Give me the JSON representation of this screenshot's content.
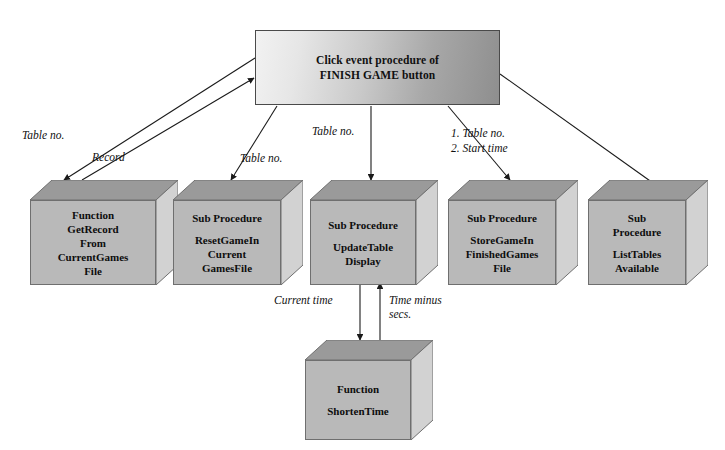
{
  "diagram": {
    "background_color": "#ffffff",
    "box_fill_color": "#b9b9b9",
    "box_top_face_color": "#9a9a9a",
    "box_side_face_color": "#d2d2d2",
    "line_color": "#1a1a1a"
  },
  "root": {
    "line1": "Click event procedure of",
    "line2": "FINISH GAME button"
  },
  "modules": [
    {
      "id": "get-record",
      "kind": "Function",
      "header": "Function",
      "header_lines": [
        "Function"
      ],
      "name_lines": [
        "GetRecord",
        "From",
        "CurrentGames",
        "File"
      ],
      "continuous": true
    },
    {
      "id": "reset-game",
      "kind": "Sub Procedure",
      "header": "Sub Procedure",
      "header_lines": [
        "Sub Procedure"
      ],
      "name_lines": [
        "ResetGameIn",
        "Current",
        "GamesFile"
      ],
      "continuous": false
    },
    {
      "id": "update-table-display",
      "kind": "Sub Procedure",
      "header": "Sub Procedure",
      "header_lines": [
        "Sub Procedure"
      ],
      "name_lines": [
        "UpdateTable",
        "Display"
      ],
      "continuous": false
    },
    {
      "id": "store-game",
      "kind": "Sub Procedure",
      "header": "Sub Procedure",
      "header_lines": [
        "Sub Procedure"
      ],
      "name_lines": [
        "StoreGameIn",
        "FinishedGames",
        "File"
      ],
      "continuous": false
    },
    {
      "id": "list-tables",
      "kind": "Sub Procedure",
      "header": "Sub Procedure",
      "header_lines": [
        "Sub",
        "Procedure"
      ],
      "name_lines": [
        "ListTables",
        "Available"
      ],
      "continuous": false
    },
    {
      "id": "shorten-time",
      "kind": "Function",
      "header": "Function",
      "header_lines": [
        "Function"
      ],
      "name_lines": [
        "ShortenTime"
      ],
      "continuous": false
    }
  ],
  "edge_labels": [
    {
      "id": "table-no-1",
      "text": "Table no."
    },
    {
      "id": "record",
      "text": "Record"
    },
    {
      "id": "table-no-2",
      "text": "Table no."
    },
    {
      "id": "table-no-3",
      "text": "Table no."
    },
    {
      "id": "table-no-4",
      "text": "1. Table no."
    },
    {
      "id": "start-time",
      "text": "2. Start time"
    },
    {
      "id": "current-time",
      "text": "Current time"
    },
    {
      "id": "time-minus",
      "text": "Time minus secs."
    }
  ]
}
